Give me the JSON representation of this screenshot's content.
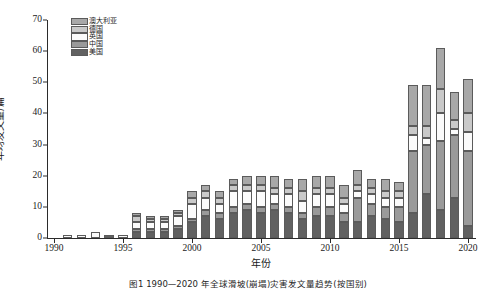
{
  "chart_data": {
    "type": "bar",
    "stacked": true,
    "title": "",
    "xlabel": "年份",
    "ylabel": "年均发文量/篇",
    "ylim": [
      0,
      70
    ],
    "ytick_step": 10,
    "yticks": [
      0,
      10,
      20,
      30,
      40,
      50,
      60,
      70
    ],
    "xlim": [
      1989.5,
      2020.5
    ],
    "xticks": [
      1990,
      1995,
      2000,
      2005,
      2010,
      2015,
      2020
    ],
    "grid": false,
    "legend_position": "top-left",
    "categories": [
      1990,
      1991,
      1992,
      1993,
      1994,
      1995,
      1996,
      1997,
      1998,
      1999,
      2000,
      2001,
      2002,
      2003,
      2004,
      2005,
      2006,
      2007,
      2008,
      2009,
      2010,
      2011,
      2012,
      2013,
      2014,
      2015,
      2016,
      2017,
      2018,
      2019,
      2020
    ],
    "series": [
      {
        "name": "美国",
        "color": "#616161",
        "values": [
          0,
          0,
          0,
          0,
          1,
          0,
          2,
          2,
          2,
          3,
          5,
          7,
          6,
          8,
          9,
          8,
          9,
          8,
          6,
          7,
          7,
          5,
          5,
          7,
          6,
          5,
          8,
          14,
          9,
          13,
          4
        ]
      },
      {
        "name": "中国",
        "color": "#9a9a9a",
        "values": [
          0,
          0,
          0,
          0,
          0,
          0,
          1,
          1,
          1,
          1,
          1,
          2,
          2,
          2,
          2,
          2,
          2,
          2,
          2,
          3,
          3,
          3,
          8,
          4,
          4,
          5,
          20,
          16,
          22,
          20,
          24
        ]
      },
      {
        "name": "英国",
        "color": "#fbfbfb",
        "values": [
          0,
          1,
          1,
          2,
          0,
          1,
          2,
          2,
          2,
          3,
          5,
          4,
          3,
          5,
          4,
          5,
          3,
          4,
          4,
          4,
          4,
          3,
          2,
          3,
          3,
          3,
          5,
          2,
          9,
          2,
          6
        ]
      },
      {
        "name": "德国",
        "color": "#c9c9c9",
        "values": [
          0,
          0,
          0,
          0,
          0,
          0,
          2,
          1,
          1,
          1,
          2,
          2,
          2,
          2,
          2,
          2,
          2,
          2,
          3,
          2,
          2,
          2,
          2,
          2,
          2,
          2,
          3,
          4,
          8,
          3,
          6
        ]
      },
      {
        "name": "澳大利亚",
        "color": "#a8a8a8",
        "values": [
          0,
          0,
          0,
          0,
          0,
          0,
          1,
          1,
          1,
          1,
          2,
          2,
          2,
          2,
          3,
          3,
          4,
          3,
          4,
          4,
          4,
          4,
          5,
          3,
          4,
          3,
          13,
          13,
          13,
          9,
          11
        ]
      }
    ],
    "totals": [
      0,
      1,
      1,
      2,
      1,
      1,
      8,
      7,
      7,
      9,
      15,
      17,
      15,
      19,
      20,
      20,
      20,
      19,
      19,
      20,
      20,
      17,
      22,
      19,
      19,
      18,
      49,
      49,
      61,
      47,
      51
    ]
  },
  "caption": "图1  1990—2020 年全球滑坡(崩塌)灾害发文量趋势(按国别)",
  "axis": {
    "y_title": "年均发文量/篇",
    "x_title": "年份"
  },
  "legend": {
    "items": [
      {
        "label": "澳大利亚",
        "color": "#a8a8a8"
      },
      {
        "label": "德国",
        "color": "#c9c9c9"
      },
      {
        "label": "英国",
        "color": "#fbfbfb"
      },
      {
        "label": "中国",
        "color": "#9a9a9a"
      },
      {
        "label": "美国",
        "color": "#616161"
      }
    ]
  }
}
